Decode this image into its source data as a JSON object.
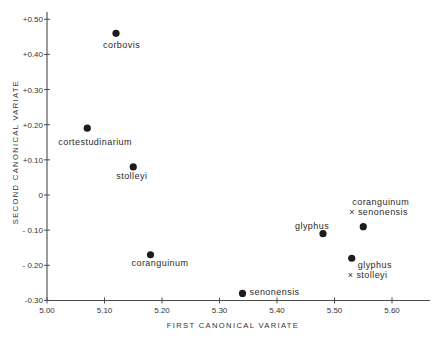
{
  "chart_data": {
    "type": "scatter",
    "title": "",
    "xlabel": "FIRST CANONICAL VARIATE",
    "ylabel": "SECOND CANONICAL VARIATE",
    "xlim": [
      5.0,
      5.66
    ],
    "ylim": [
      -0.3,
      0.52
    ],
    "grid": false,
    "legend": null,
    "x_ticks": [
      5.0,
      5.1,
      5.2,
      5.3,
      5.4,
      5.5,
      5.6
    ],
    "x_tick_labels": [
      "5.00",
      "5.10",
      "5.20",
      "5.30",
      "5.40",
      "5.50",
      "5.60"
    ],
    "y_ticks": [
      0.5,
      0.4,
      0.3,
      0.2,
      0.1,
      0.0,
      -0.1,
      -0.2,
      -0.3
    ],
    "y_tick_labels": [
      "+0.50",
      "+0.40",
      "+0.30",
      "+0.20",
      "+0.10",
      "0",
      "- 0.10",
      "- 0.20",
      "-0.30"
    ],
    "points": [
      {
        "label": "corbovis",
        "x": 5.12,
        "y": 0.46,
        "marker": "dot",
        "label_lines": [
          "corbovis"
        ],
        "label_offsets": [
          [
            -13,
            12
          ]
        ]
      },
      {
        "label": "cortestudinarium",
        "x": 5.07,
        "y": 0.19,
        "marker": "dot",
        "label_lines": [
          "cortestudinarium"
        ],
        "label_offsets": [
          [
            -29,
            14
          ]
        ]
      },
      {
        "label": "stolleyi",
        "x": 5.15,
        "y": 0.08,
        "marker": "dot",
        "label_lines": [
          "stolleyi"
        ],
        "label_offsets": [
          [
            -17,
            9
          ]
        ]
      },
      {
        "label": "coranguinum",
        "x": 5.18,
        "y": -0.17,
        "marker": "dot",
        "label_lines": [
          "coranguinum"
        ],
        "label_offsets": [
          [
            -19,
            8
          ]
        ]
      },
      {
        "label": "senonensis",
        "x": 5.34,
        "y": -0.28,
        "marker": "dot",
        "label_lines": [
          "senonensis"
        ],
        "label_offsets": [
          [
            7,
            -1
          ]
        ]
      },
      {
        "label": "glyphus",
        "x": 5.48,
        "y": -0.11,
        "marker": "dot",
        "label_lines": [
          "glyphus"
        ],
        "label_offsets": [
          [
            -28,
            -8
          ]
        ]
      },
      {
        "label": "coranguinum × senonensis",
        "x": 5.55,
        "y": -0.09,
        "marker": "dot",
        "label_lines": [
          "coranguinum",
          "× senonensis"
        ],
        "label_offsets": [
          [
            -11,
            -25
          ],
          [
            -14,
            -15
          ]
        ]
      },
      {
        "label": "glyphus × stolleyi",
        "x": 5.53,
        "y": -0.18,
        "marker": "dot",
        "label_lines": [
          "glyphus",
          "× stolleyi"
        ],
        "label_offsets": [
          [
            6,
            7
          ],
          [
            -4,
            17
          ]
        ]
      }
    ]
  }
}
